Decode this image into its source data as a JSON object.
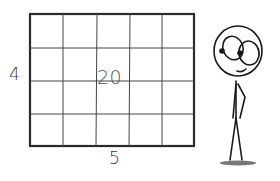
{
  "diagram": {
    "rectangle": {
      "columns": 5,
      "rows": 4,
      "width_label": "5",
      "height_label": "4",
      "area_label": "20"
    },
    "character": {
      "description": "stick figure looking at the grid",
      "expression": "smiling"
    }
  }
}
